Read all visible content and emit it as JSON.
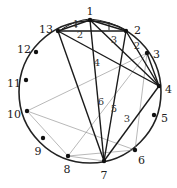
{
  "diagram": {
    "type": "circle-chord-graph",
    "vertices": [
      {
        "id": "1",
        "label": "1"
      },
      {
        "id": "2",
        "label": "2"
      },
      {
        "id": "3",
        "label": "3"
      },
      {
        "id": "4",
        "label": "4"
      },
      {
        "id": "5",
        "label": "5"
      },
      {
        "id": "6",
        "label": "6"
      },
      {
        "id": "7",
        "label": "7"
      },
      {
        "id": "8",
        "label": "8"
      },
      {
        "id": "9",
        "label": "9"
      },
      {
        "id": "10",
        "label": "10"
      },
      {
        "id": "11",
        "label": "11"
      },
      {
        "id": "12",
        "label": "12"
      },
      {
        "id": "13",
        "label": "13"
      }
    ],
    "thick_edges": [
      {
        "from": "13",
        "to": "1",
        "label": "1"
      },
      {
        "from": "13",
        "to": "2",
        "label": "2"
      },
      {
        "from": "1",
        "to": "2",
        "label": ""
      },
      {
        "from": "1",
        "to": "4",
        "label": "3"
      },
      {
        "from": "2",
        "to": "4",
        "label": "2"
      },
      {
        "from": "13",
        "to": "4",
        "label": ""
      },
      {
        "from": "3",
        "to": "4",
        "label": ""
      },
      {
        "from": "1",
        "to": "7",
        "label": "4"
      },
      {
        "from": "13",
        "to": "7",
        "label": "6"
      },
      {
        "from": "2",
        "to": "7",
        "label": "5"
      },
      {
        "from": "4",
        "to": "7",
        "label": "3"
      }
    ],
    "thin_edges": [
      {
        "from": "10",
        "to": "3"
      },
      {
        "from": "10",
        "to": "6"
      },
      {
        "from": "10",
        "to": "8"
      },
      {
        "from": "8",
        "to": "6"
      },
      {
        "from": "8",
        "to": "3"
      },
      {
        "from": "8",
        "to": "7"
      },
      {
        "from": "3",
        "to": "6"
      },
      {
        "from": "2",
        "to": "4"
      }
    ]
  }
}
